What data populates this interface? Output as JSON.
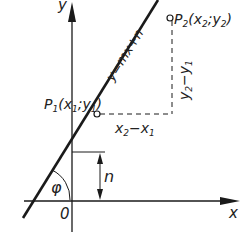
{
  "diagram": {
    "axes": {
      "x_label": "x",
      "y_label": "y",
      "origin_label": "0"
    },
    "line": {
      "equation": "y=mx+n"
    },
    "points": [
      {
        "name": "P",
        "sub": "1",
        "coords_open": "(x",
        "x_sub": "1",
        "sep": ";y",
        "y_sub": "1",
        "close": ")"
      },
      {
        "name": "P",
        "sub": "2",
        "coords_open": "(x",
        "x_sub": "2",
        "sep": ";y",
        "y_sub": "2",
        "close": ")"
      }
    ],
    "differences": {
      "dx": {
        "a": "x",
        "a_sub": "2",
        "op": "−x",
        "b_sub": "1"
      },
      "dy": {
        "a": "y",
        "a_sub": "2",
        "op": "−y",
        "b_sub": "1"
      }
    },
    "intercept_label": "n",
    "angle_label": "φ",
    "colors": {
      "stroke": "#1a1a1a",
      "background": "#ffffff"
    }
  }
}
